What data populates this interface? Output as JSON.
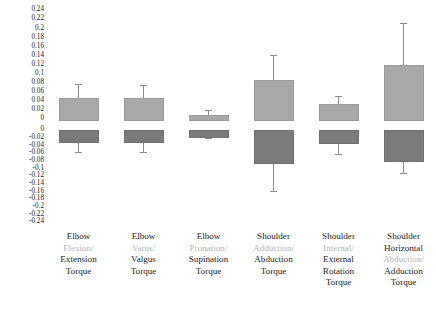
{
  "chart_data": {
    "type": "bar",
    "title": "",
    "subtitle": "",
    "xlabel": "",
    "ylabel": "",
    "grid": false,
    "legend": false,
    "orientation": "vertical",
    "axis_note": "Mirrored split axis: upper half 0 to 0.24 (positive series), lower half 0 to -0.24 (negative series)",
    "ylim": [
      -0.24,
      0.24
    ],
    "y_ticks_upper": [
      "0.24",
      "0.22",
      "0.2",
      "0.18",
      "0.16",
      "0.14",
      "0.12",
      "0.1",
      "0.08",
      "0.06",
      "0.04",
      "0.02",
      "0"
    ],
    "y_ticks_lower": [
      "0",
      "-0.02",
      "-0.04",
      "-0.06",
      "-0.08",
      "-0.1",
      "-0.12",
      "-0.14",
      "-0.16",
      "-0.18",
      "-0.2",
      "-0.22",
      "-0.24"
    ],
    "categories": [
      {
        "lines": [
          {
            "text": "Elbow",
            "faint": false
          },
          {
            "text": "Flexion/",
            "faint": true
          },
          {
            "text": "Extension",
            "faint": false
          },
          {
            "text": "Torque",
            "faint": false
          }
        ]
      },
      {
        "lines": [
          {
            "text": "Elbow",
            "faint": false
          },
          {
            "text": "Varus/",
            "faint": true
          },
          {
            "text": "Valgus",
            "faint": false
          },
          {
            "text": "Torque",
            "faint": false
          }
        ]
      },
      {
        "lines": [
          {
            "text": "Elbow",
            "faint": false
          },
          {
            "text": "Pronation/",
            "faint": true
          },
          {
            "text": "Supination",
            "faint": false
          },
          {
            "text": "Torque",
            "faint": false
          }
        ]
      },
      {
        "lines": [
          {
            "text": "Shoulder",
            "faint": false
          },
          {
            "text": "Adduction/",
            "faint": true
          },
          {
            "text": "Abduction",
            "faint": false
          },
          {
            "text": "Torque",
            "faint": false
          }
        ]
      },
      {
        "lines": [
          {
            "text": "Shoulder",
            "faint": false
          },
          {
            "text": "Internal/",
            "faint": true
          },
          {
            "text": "External",
            "faint": false
          },
          {
            "text": "Rotation",
            "faint": false
          },
          {
            "text": "Torque",
            "faint": false
          }
        ]
      },
      {
        "lines": [
          {
            "text": "Shoulder",
            "faint": false
          },
          {
            "text": "Horizontal",
            "faint": false
          },
          {
            "text": "Abduction/",
            "faint": true
          },
          {
            "text": "Adduction",
            "faint": false
          },
          {
            "text": "Torque",
            "faint": false
          }
        ]
      }
    ],
    "series": [
      {
        "name": "positive",
        "color": "#a8a8a8",
        "values": [
          0.046,
          0.046,
          0.008,
          0.085,
          0.032,
          0.118
        ],
        "errors_upper": [
          0.078,
          0.075,
          0.019,
          0.14,
          0.05,
          0.212
        ],
        "errors_lower": [
          0.0,
          0.0,
          0.0,
          0.0,
          0.0,
          0.0
        ]
      },
      {
        "name": "negative",
        "color": "#7b7b7b",
        "values": [
          -0.028,
          -0.028,
          -0.015,
          -0.083,
          -0.03,
          -0.078
        ],
        "errors_lower": [
          -0.058,
          -0.058,
          -0.022,
          -0.16,
          -0.062,
          -0.112
        ],
        "errors_upper": [
          0.0,
          0.0,
          0.0,
          0.0,
          0.0,
          0.0
        ]
      }
    ]
  }
}
